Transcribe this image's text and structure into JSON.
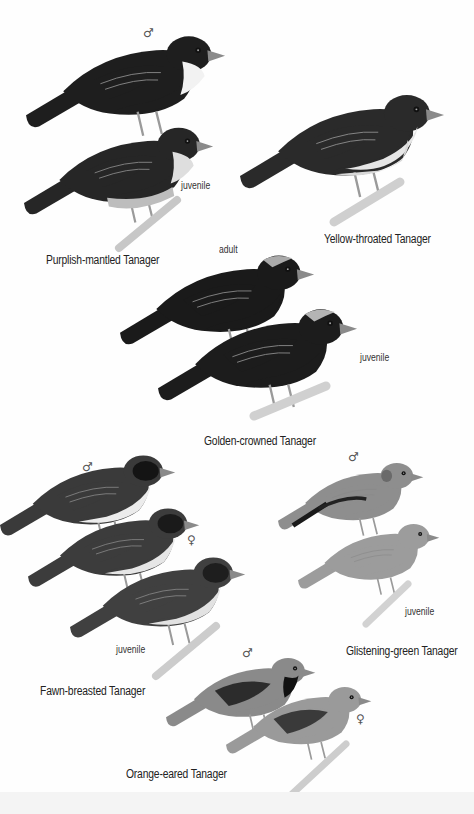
{
  "plate": {
    "background": "#ffffff",
    "species": [
      {
        "name": "Purplish-mantled Tanager",
        "figures": [
          {
            "annotation": "♂",
            "annotation_name": "male-symbol"
          },
          {
            "annotation": "juvenile"
          }
        ]
      },
      {
        "name": "Yellow-throated Tanager",
        "figures": [
          {
            "annotation": ""
          }
        ]
      },
      {
        "name": "Golden-crowned Tanager",
        "figures": [
          {
            "annotation": "adult"
          },
          {
            "annotation": "juvenile"
          }
        ]
      },
      {
        "name": "Fawn-breasted Tanager",
        "figures": [
          {
            "annotation": ""
          },
          {
            "annotation": "♀",
            "annotation_name": "female-symbol"
          },
          {
            "annotation": "juvenile"
          }
        ]
      },
      {
        "name": "Glistening-green Tanager",
        "figures": [
          {
            "annotation": "♂",
            "annotation_name": "male-symbol"
          },
          {
            "annotation": "juvenile"
          }
        ]
      },
      {
        "name": "Orange-eared Tanager",
        "figures": [
          {
            "annotation": "♂",
            "annotation_name": "male-symbol"
          },
          {
            "annotation": "♀",
            "annotation_name": "female-symbol"
          }
        ]
      }
    ]
  },
  "colors": {
    "dark_plumage": "#1e1e1e",
    "mid_plumage": "#4a4a4a",
    "light_plumage": "#9a9a9a",
    "pale_belly": "#e2e2e2",
    "branch": "#c9c9c9",
    "label_text": "#222222"
  }
}
